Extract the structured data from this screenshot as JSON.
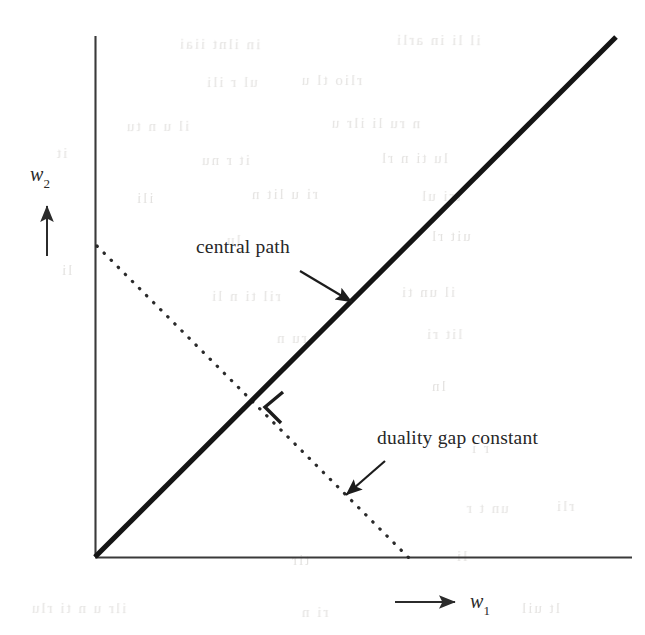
{
  "figure": {
    "kind": "line-diagram",
    "background_color": "#ffffff",
    "ink_color": "#1c1c1c",
    "axes": {
      "origin": {
        "x": 95,
        "y": 557
      },
      "x_axis": {
        "name": "horizontal-axis",
        "from": {
          "x": 95,
          "y": 557
        },
        "to": {
          "x": 632,
          "y": 557
        }
      },
      "y_axis": {
        "name": "vertical-axis",
        "from": {
          "x": 95,
          "y": 557
        },
        "to": {
          "x": 95,
          "y": 36
        }
      },
      "x_label": {
        "symbol": "w",
        "subscript": "1",
        "text": "w1"
      },
      "y_label": {
        "symbol": "w",
        "subscript": "2",
        "text": "w2"
      }
    },
    "annotations": [
      {
        "id": "central-path",
        "label": "central path",
        "text_pos": {
          "x": 196,
          "y": 238
        },
        "arrow_from": {
          "x": 300,
          "y": 271
        },
        "arrow_to": {
          "x": 353,
          "y": 303
        }
      },
      {
        "id": "duality-gap-constant",
        "label": "duality gap constant",
        "text_pos": {
          "x": 377,
          "y": 429
        },
        "arrow_from": {
          "x": 384,
          "y": 462
        },
        "arrow_to": {
          "x": 344,
          "y": 496
        }
      }
    ],
    "curves": [
      {
        "id": "central-path-line",
        "style": "solid-thick",
        "stroke_width": 5,
        "from": {
          "x": 95,
          "y": 557
        },
        "to": {
          "x": 616,
          "y": 37
        },
        "description": "thick solid diagonal ray from origin"
      },
      {
        "id": "duality-gap-line",
        "style": "dotted",
        "stroke_width": 3.2,
        "from": {
          "x": 97,
          "y": 246
        },
        "to": {
          "x": 409,
          "y": 558
        },
        "description": "dotted line of constant duality gap"
      }
    ],
    "markers": [
      {
        "id": "right-angle-mark",
        "shape": "chevron",
        "at": {
          "x": 272,
          "y": 406
        },
        "description": "angle bracket marker at intersection of central path and duality gap line"
      }
    ]
  },
  "chart_data": {
    "type": "line",
    "title": "",
    "xlabel": "w1",
    "ylabel": "w2",
    "grid": false,
    "legend": "none",
    "series": [
      {
        "name": "central path",
        "style": "solid",
        "x": [
          0,
          1
        ],
        "y": [
          0,
          1
        ]
      },
      {
        "name": "duality gap constant",
        "style": "dotted",
        "x": [
          0,
          0.585
        ],
        "y": [
          0.598,
          0
        ]
      }
    ],
    "annotations": [
      "central path",
      "duality gap constant"
    ]
  },
  "ghost_text": {
    "note": "faint scanner bleed-through from reverse page; illegible",
    "lines": [
      {
        "x": 178,
        "y": 36,
        "text": "in ilnt iiai",
        "size": 15,
        "rot": -0.4
      },
      {
        "x": 395,
        "y": 32,
        "text": "il li in  arli",
        "size": 15,
        "rot": -0.3
      },
      {
        "x": 205,
        "y": 74,
        "text": "ul  r ili",
        "size": 15,
        "rot": 0.2
      },
      {
        "x": 300,
        "y": 72,
        "text": "rlio  tl u",
        "size": 15,
        "rot": -0.2
      },
      {
        "x": 125,
        "y": 118,
        "text": "il  u n  tu",
        "size": 15,
        "rot": 0.3
      },
      {
        "x": 330,
        "y": 115,
        "text": "n ru li  ilr u",
        "size": 15,
        "rot": -0.3
      },
      {
        "x": 200,
        "y": 152,
        "text": "it  r  nu",
        "size": 15,
        "rot": 0.1
      },
      {
        "x": 380,
        "y": 150,
        "text": "lu ti  n rl",
        "size": 15,
        "rot": -0.2
      },
      {
        "x": 135,
        "y": 190,
        "text": "ili",
        "size": 15,
        "rot": 0.0
      },
      {
        "x": 250,
        "y": 186,
        "text": "ri u  lit  n",
        "size": 15,
        "rot": 0.2
      },
      {
        "x": 420,
        "y": 188,
        "text": "tri ul",
        "size": 15,
        "rot": -0.3
      },
      {
        "x": 225,
        "y": 232,
        "text": "lu",
        "size": 15,
        "rot": 0.1
      },
      {
        "x": 430,
        "y": 228,
        "text": "uit  rl",
        "size": 15,
        "rot": 0.0
      },
      {
        "x": 210,
        "y": 288,
        "text": "ril ti n  li",
        "size": 15,
        "rot": -0.2
      },
      {
        "x": 400,
        "y": 284,
        "text": "il un ti",
        "size": 15,
        "rot": 0.2
      },
      {
        "x": 275,
        "y": 330,
        "text": "ru  n",
        "size": 15,
        "rot": 0.1
      },
      {
        "x": 425,
        "y": 326,
        "text": "lit  ri",
        "size": 15,
        "rot": -0.2
      },
      {
        "x": 430,
        "y": 378,
        "text": "ln",
        "size": 15,
        "rot": 0.0
      },
      {
        "x": 470,
        "y": 440,
        "text": "r i",
        "size": 15,
        "rot": 0.1
      },
      {
        "x": 465,
        "y": 500,
        "text": "un  t r",
        "size": 15,
        "rot": -0.2
      },
      {
        "x": 555,
        "y": 498,
        "text": "rli",
        "size": 15,
        "rot": 0.2
      },
      {
        "x": 290,
        "y": 552,
        "text": "tir",
        "size": 15,
        "rot": 0.0
      },
      {
        "x": 455,
        "y": 548,
        "text": "li",
        "size": 15,
        "rot": 0.1
      },
      {
        "x": 30,
        "y": 600,
        "text": "ilr u   n ti  rlu",
        "size": 15,
        "rot": -0.2
      },
      {
        "x": 300,
        "y": 604,
        "text": "ri n",
        "size": 15,
        "rot": 0.1
      },
      {
        "x": 520,
        "y": 600,
        "text": "lt  uil",
        "size": 15,
        "rot": -0.1
      },
      {
        "x": 60,
        "y": 262,
        "text": "li",
        "size": 15,
        "rot": 0.0
      },
      {
        "x": 55,
        "y": 145,
        "text": "it",
        "size": 15,
        "rot": 0.1
      }
    ]
  }
}
